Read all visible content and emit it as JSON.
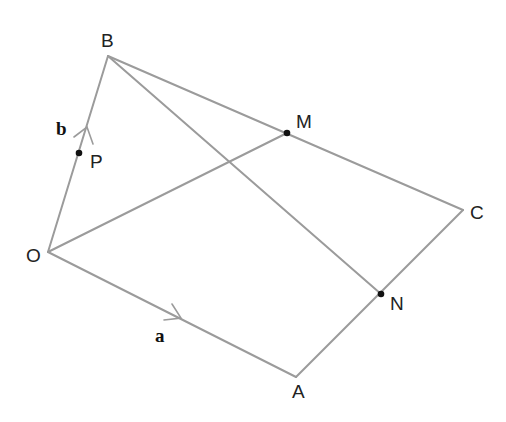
{
  "diagram": {
    "type": "vector geometry figure",
    "colors": {
      "line": "#9b9b9b",
      "point": "#111111",
      "text": "#222222"
    },
    "vertices": {
      "O": {
        "label": "O",
        "x": 48,
        "y": 252
      },
      "B": {
        "label": "B",
        "x": 108,
        "y": 56
      },
      "C": {
        "label": "C",
        "x": 463,
        "y": 210
      },
      "A": {
        "label": "A",
        "x": 296,
        "y": 377
      }
    },
    "points": {
      "M": {
        "label": "M",
        "x": 287,
        "y": 133,
        "on": "BC"
      },
      "N": {
        "label": "N",
        "x": 381,
        "y": 294,
        "on": "AC"
      },
      "P": {
        "label": "P",
        "x": 79,
        "y": 152,
        "on": "OB"
      }
    },
    "segments": [
      "OB",
      "BC",
      "CA",
      "AO",
      "OM",
      "BN"
    ],
    "vectors": {
      "a": {
        "label": "a",
        "along": "OA"
      },
      "b": {
        "label": "b",
        "along": "OB"
      }
    }
  }
}
